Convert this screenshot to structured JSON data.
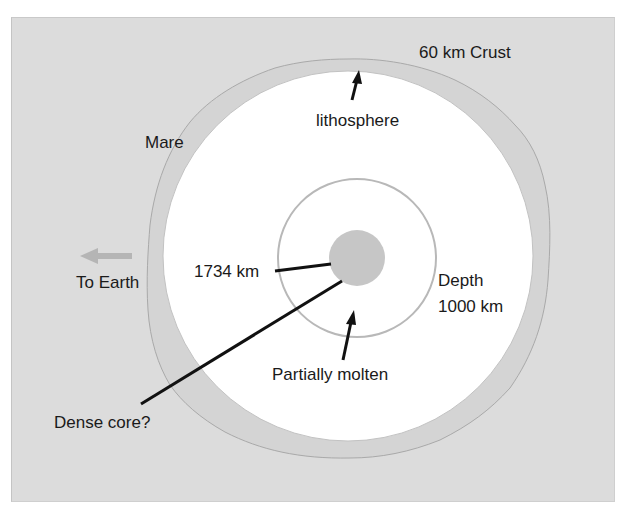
{
  "diagram": {
    "colors": {
      "background_panel": "#dcdcdc",
      "interior": "#ffffff",
      "core": "#c6c6c6",
      "lines": "#111111",
      "arrow_to_earth": "#b5b5b5"
    },
    "labels": {
      "crust": "60 km Crust",
      "lithosphere": "lithosphere",
      "mare": "Mare",
      "to_earth": "To Earth",
      "radius": "1734 km",
      "depth_line1": "Depth",
      "depth_line2": "1000 km",
      "partially_molten": "Partially molten",
      "dense_core": "Dense core?"
    },
    "icons": {
      "to_earth_arrow": "left-arrow-icon"
    }
  }
}
